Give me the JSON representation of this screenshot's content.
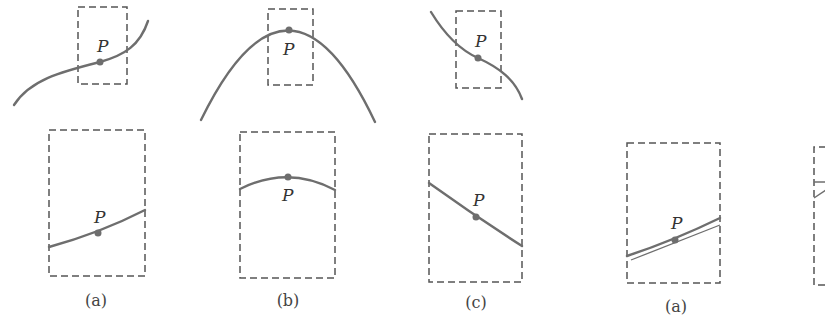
{
  "figure": {
    "point_label": "P",
    "panels": [
      {
        "id": "a",
        "caption": "(a)",
        "shape": "increasing S-curve",
        "zoomed": "nearly straight increasing segment"
      },
      {
        "id": "b",
        "caption": "(b)",
        "shape": "downward parabola with P at the peak",
        "zoomed": "flat arc with P at the top"
      },
      {
        "id": "c",
        "caption": "(c)",
        "shape": "decreasing S-curve",
        "zoomed": "nearly straight decreasing segment"
      },
      {
        "id": "a2",
        "caption": "(a)",
        "shape": "zoomed curve with tangent line through P",
        "zoomed": "curve and tangent nearly coincide"
      }
    ],
    "colors": {
      "curve": "#6e6e6e",
      "box": "#555555",
      "text": "#333333"
    }
  }
}
